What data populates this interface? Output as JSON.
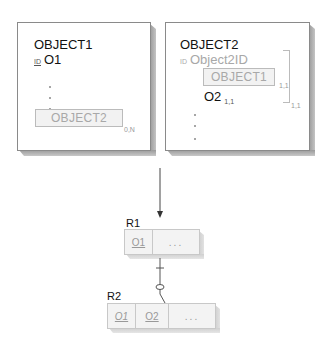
{
  "left_panel": {
    "title": "OBJECT1",
    "id_label": "ID",
    "id_attr": "O1",
    "nested_object": "OBJECT2",
    "nested_cardinality": "0,N"
  },
  "right_panel": {
    "title": "OBJECT2",
    "id_label": "ID",
    "id_attr": "Object2ID",
    "nested_object": "OBJECT1",
    "nested_cardinality": "1,1",
    "attr": "O2",
    "attr_cardinality": "1,1",
    "bracket_cardinality": "1,1"
  },
  "relations": {
    "r1": {
      "label": "R1",
      "columns": [
        {
          "text": "O1",
          "style": "key"
        },
        {
          "text": "...",
          "style": "plain"
        }
      ]
    },
    "r2": {
      "label": "R2",
      "columns": [
        {
          "text": "O1",
          "style": "foreign-key"
        },
        {
          "text": "O2",
          "style": "key"
        },
        {
          "text": "...",
          "style": "plain"
        }
      ]
    },
    "link": {
      "from": "R2",
      "to": "R1",
      "r1_end": "one (bar)",
      "r2_end": "zero-or-one (circle)"
    }
  }
}
